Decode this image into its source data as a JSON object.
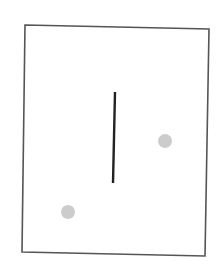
{
  "canvas": {
    "width": 221,
    "height": 261,
    "background": "#ffffff"
  },
  "frame": {
    "points": [
      [
        25,
        25
      ],
      [
        209,
        29
      ],
      [
        205,
        256
      ],
      [
        22,
        252
      ]
    ],
    "stroke": "#555555",
    "stroke_width": 1.6
  },
  "divider_line": {
    "x1": 115,
    "y1": 92,
    "x2": 113,
    "y2": 183,
    "stroke": "#222222",
    "stroke_width": 2.4
  },
  "dots": [
    {
      "cx": 165,
      "cy": 141,
      "r": 7,
      "fill": "#cccccc"
    },
    {
      "cx": 68,
      "cy": 212,
      "r": 7,
      "fill": "#cccccc"
    }
  ]
}
